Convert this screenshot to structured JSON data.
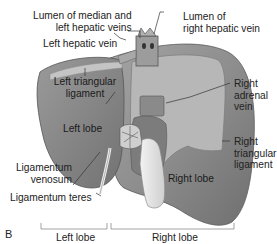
{
  "figure": {
    "panel_letter": "B",
    "colors": {
      "liver_surface": "#8e8e8e",
      "liver_dark": "#6e6e6e",
      "bare_area": "#b9b9b9",
      "gallbladder": "#e6e6e6",
      "line": "#333333",
      "bracket": "#8a8a8a",
      "text": "#222222"
    }
  },
  "labels": {
    "lumen_median_left": [
      "Lumen of median and",
      "left hepatic veins"
    ],
    "lumen_right": [
      "Lumen of",
      "right hepatic vein"
    ],
    "left_hepatic_vein": "Left hepatic vein",
    "left_triangular": [
      "Left triangular",
      "ligament"
    ],
    "left_lobe_inner": "Left lobe",
    "right_adrenal": [
      "Right",
      "adrenal",
      "vein"
    ],
    "right_triangular": [
      "Right",
      "triangular",
      "ligament"
    ],
    "ligamentum_venosum": [
      "Ligamentum",
      "venosum"
    ],
    "ligamentum_teres": "Ligamentum teres",
    "right_lobe_inner": "Right lobe"
  },
  "brackets": {
    "left": "Left lobe",
    "right": "Right lobe"
  }
}
